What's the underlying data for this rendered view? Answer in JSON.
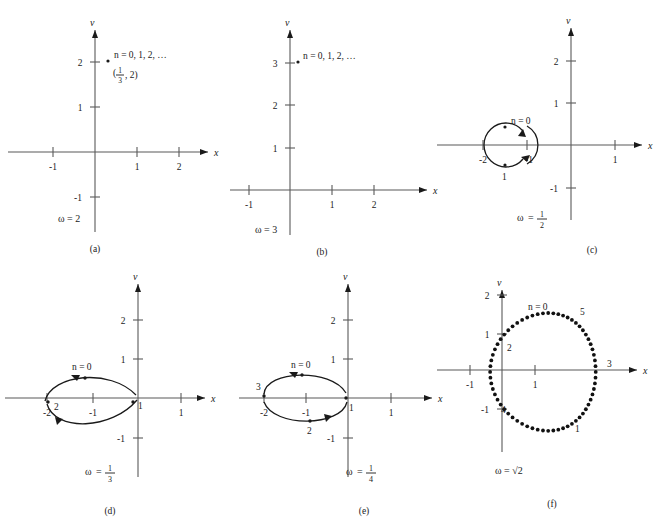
{
  "figure": {
    "axis_labels": {
      "x": "x",
      "v": "v"
    },
    "omega_symbol": "ω",
    "equals": "="
  },
  "panels": [
    {
      "id": "a",
      "caption": "(a)",
      "omega_text": "ω = 2",
      "omega_value": "2",
      "omega_is_fraction": false,
      "x_ticks": [
        "-1",
        "1",
        "2"
      ],
      "x_tick_values": [
        -1,
        1,
        2
      ],
      "v_ticks": [
        "2",
        "1",
        "-1"
      ],
      "v_tick_values": [
        2,
        1,
        -1
      ],
      "n_label": "n = 0, 1, 2, …",
      "coord_label_num": "1",
      "coord_label_den": "3",
      "coord_label_tail": ", 2)",
      "coord_label_head": "(",
      "points": [
        {
          "label": "",
          "x": 0.33,
          "y": 2
        }
      ],
      "orbit": "none"
    },
    {
      "id": "b",
      "caption": "(b)",
      "omega_text": "ω = 3",
      "omega_value": "3",
      "omega_is_fraction": false,
      "x_ticks": [
        "-1",
        "1",
        "2"
      ],
      "x_tick_values": [
        -1,
        1,
        2
      ],
      "v_ticks": [
        "3",
        "2",
        "1"
      ],
      "v_tick_values": [
        3,
        2,
        1
      ],
      "n_label": "n = 0, 1, 2, …",
      "points": [
        {
          "label": "",
          "x": 0.1,
          "y": 3
        }
      ],
      "orbit": "none"
    },
    {
      "id": "c",
      "caption": "(c)",
      "omega_text": "ω = 1/2",
      "omega_num": "1",
      "omega_den": "2",
      "omega_is_fraction": true,
      "x_ticks": [
        "-2",
        "1"
      ],
      "x_tick_values": [
        -2,
        1
      ],
      "v_ticks": [
        "2",
        "1",
        "-1"
      ],
      "v_tick_values": [
        2,
        1,
        -1
      ],
      "n_label": "n = 0",
      "orbit": "circle",
      "orbit_center_x": -1.5,
      "orbit_center_y": 0,
      "orbit_rx": 0.5,
      "orbit_ry": 0.5,
      "inner_tick_label": "-1",
      "points": [
        {
          "label": "",
          "x": -1.5,
          "y": 0.42
        },
        {
          "label": "1",
          "x": -1.5,
          "y": -0.46
        }
      ]
    },
    {
      "id": "d",
      "caption": "(d)",
      "omega_text": "ω = 1/3",
      "omega_num": "1",
      "omega_den": "3",
      "omega_is_fraction": true,
      "x_ticks": [
        "-2",
        "-1",
        "1"
      ],
      "x_tick_values": [
        -2,
        -1,
        1
      ],
      "v_ticks": [
        "2",
        "1",
        "-1"
      ],
      "v_tick_values": [
        2,
        1,
        -1
      ],
      "n_label": "n = 0",
      "orbit": "lens",
      "orbit_left": -2,
      "orbit_right": 0,
      "orbit_height": 0.52,
      "points": [
        {
          "label": "",
          "x": -1.05,
          "y": 0.42
        },
        {
          "label": "2",
          "x": -1.92,
          "y": -0.03
        },
        {
          "label": "1",
          "x": -0.06,
          "y": -0.06
        }
      ]
    },
    {
      "id": "e",
      "caption": "(e)",
      "omega_text": "ω = 1/4",
      "omega_num": "1",
      "omega_den": "4",
      "omega_is_fraction": true,
      "x_ticks": [
        "-2",
        "-1",
        "1"
      ],
      "x_tick_values": [
        -2,
        -1,
        1
      ],
      "v_ticks": [
        "2",
        "1",
        "-1"
      ],
      "v_tick_values": [
        2,
        1,
        -1
      ],
      "n_label": "n = 0",
      "orbit": "ellipse",
      "orbit_center_x": -1,
      "orbit_center_y": 0,
      "orbit_rx": 1,
      "orbit_ry": 0.42,
      "points": [
        {
          "label": "",
          "x": -1.0,
          "y": 0.4
        },
        {
          "label": "3",
          "x": -2.0,
          "y": 0.04
        },
        {
          "label": "1",
          "x": -0.02,
          "y": -0.04
        },
        {
          "label": "2",
          "x": -1.0,
          "y": -0.4
        }
      ]
    },
    {
      "id": "f",
      "caption": "(f)",
      "omega_text": "ω = √2",
      "omega_value": "√2",
      "omega_is_fraction": false,
      "x_ticks": [
        "-1",
        "1"
      ],
      "x_tick_values": [
        -1,
        1
      ],
      "v_ticks": [
        "2",
        "1",
        "-1"
      ],
      "v_tick_values": [
        2,
        1,
        -1
      ],
      "n_label": "n = 0",
      "orbit": "dotted-oval",
      "orbit_center_x": 1.4,
      "orbit_center_y": -0.05,
      "orbit_rx": 1.6,
      "orbit_ry": 1.55,
      "dot_count": 64,
      "point_labels": [
        {
          "label": "5",
          "x": 2.45,
          "y": 1.18
        },
        {
          "label": "2",
          "x": -0.02,
          "y": 0.62
        },
        {
          "label": "3",
          "x": 3.05,
          "y": 0.06
        },
        {
          "label": "4",
          "x": -0.05,
          "y": -0.95
        },
        {
          "label": "1",
          "x": 1.95,
          "y": -1.6
        }
      ]
    }
  ]
}
